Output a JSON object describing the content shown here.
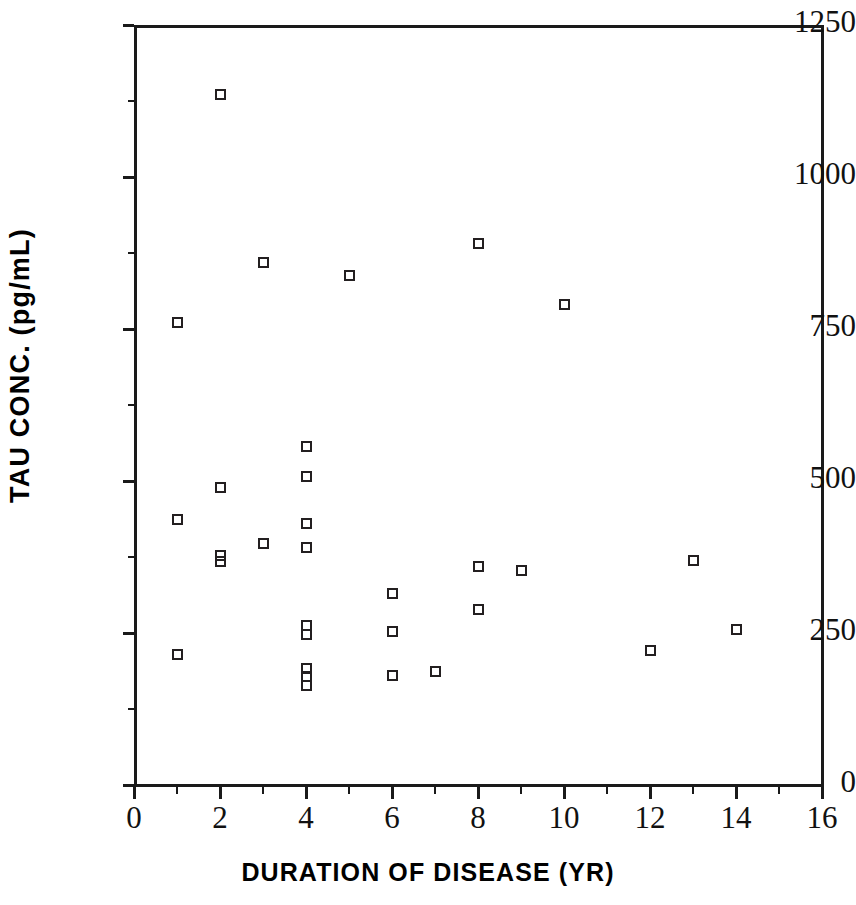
{
  "chart_data": {
    "type": "scatter",
    "title": "",
    "xlabel": "DURATION OF DISEASE (YR)",
    "ylabel": "TAU CONC.  (pg/mL)",
    "xlim": [
      0,
      16
    ],
    "ylim": [
      0,
      1250
    ],
    "xticks": [
      0,
      2,
      4,
      6,
      8,
      10,
      12,
      14,
      16
    ],
    "xtick_labels": [
      "0",
      "2",
      "4",
      "6",
      "8",
      "10",
      "12",
      "14",
      "16"
    ],
    "x_minor_ticks": [
      1,
      3,
      5,
      7,
      9,
      11,
      13,
      15
    ],
    "yticks": [
      0,
      250,
      500,
      750,
      1000,
      1250
    ],
    "ytick_labels": [
      "0",
      "250",
      "500",
      "750",
      "1000",
      "1250"
    ],
    "y_minor_ticks": [
      125,
      375,
      625,
      875,
      1125
    ],
    "grid": false,
    "legend": null,
    "marker": "open-square",
    "marker_color": "#231f20",
    "n_points": 31,
    "x": [
      1,
      2,
      3,
      5,
      8,
      10,
      1,
      2,
      4,
      4,
      3,
      4,
      2,
      2,
      8,
      13,
      9,
      6,
      8,
      4,
      4,
      6,
      12,
      14,
      1,
      4,
      4,
      4,
      6,
      7,
      0
    ],
    "y": [
      760,
      1135,
      860,
      838,
      890,
      790,
      437,
      490,
      556,
      507,
      397,
      430,
      378,
      368,
      360,
      370,
      352,
      315,
      288,
      260,
      256,
      252,
      222,
      256,
      215,
      190,
      178,
      165,
      180,
      185,
      0
    ],
    "points": [
      {
        "x": 1,
        "y": 760
      },
      {
        "x": 2,
        "y": 1135
      },
      {
        "x": 3,
        "y": 860
      },
      {
        "x": 5,
        "y": 838
      },
      {
        "x": 8,
        "y": 890
      },
      {
        "x": 10,
        "y": 790
      },
      {
        "x": 1,
        "y": 437
      },
      {
        "x": 2,
        "y": 490
      },
      {
        "x": 4,
        "y": 556
      },
      {
        "x": 4,
        "y": 507
      },
      {
        "x": 3,
        "y": 397
      },
      {
        "x": 4,
        "y": 430
      },
      {
        "x": 4,
        "y": 390
      },
      {
        "x": 2,
        "y": 378
      },
      {
        "x": 2,
        "y": 368
      },
      {
        "x": 8,
        "y": 360
      },
      {
        "x": 13,
        "y": 370
      },
      {
        "x": 9,
        "y": 352
      },
      {
        "x": 6,
        "y": 315
      },
      {
        "x": 8,
        "y": 288
      },
      {
        "x": 4,
        "y": 262
      },
      {
        "x": 4,
        "y": 248
      },
      {
        "x": 6,
        "y": 252
      },
      {
        "x": 12,
        "y": 222
      },
      {
        "x": 14,
        "y": 256
      },
      {
        "x": 1,
        "y": 215
      },
      {
        "x": 4,
        "y": 192
      },
      {
        "x": 4,
        "y": 178
      },
      {
        "x": 4,
        "y": 164
      },
      {
        "x": 6,
        "y": 180
      },
      {
        "x": 7,
        "y": 186
      }
    ]
  },
  "axes": {
    "y_axis_title": "TAU CONC.  (pg/mL)",
    "x_axis_title": "DURATION OF DISEASE (YR)"
  },
  "colors": {
    "marker": "#231f20",
    "axis": "#1a1a1a",
    "background": "#ffffff"
  }
}
